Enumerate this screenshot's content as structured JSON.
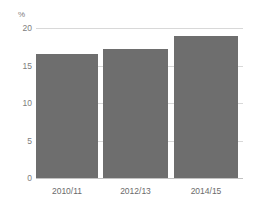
{
  "chart_data": {
    "type": "bar",
    "title": "",
    "subtitle": "",
    "xlabel": "",
    "ylabel": "%",
    "unit_label": "%",
    "categories": [
      "2010/11",
      "2012/13",
      "2014/15"
    ],
    "values": [
      16.5,
      17.2,
      19.0
    ],
    "series": [
      {
        "name": "",
        "values": [
          16.5,
          17.2,
          19.0
        ]
      }
    ],
    "ylim": [
      0,
      20
    ],
    "yticks": [
      0,
      5,
      10,
      15,
      20
    ],
    "ytick_labels": [
      "0",
      "5",
      "10",
      "15",
      "20"
    ],
    "grid": true,
    "grid_axis": "y",
    "legend": false,
    "legend_position": "none",
    "bar_color": "#6e6e6e",
    "grid_color": "#d8d8d8",
    "axis_text_color": "#7d7d7d",
    "background_color": "#ffffff"
  }
}
